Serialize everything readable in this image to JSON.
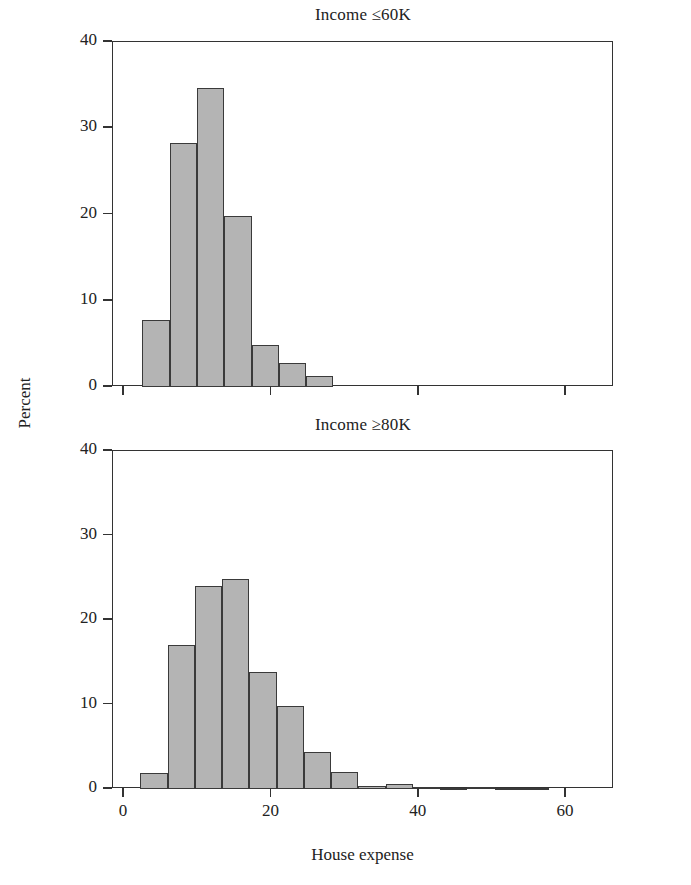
{
  "figure": {
    "ylabel": "Percent",
    "xlabel": "House expense"
  },
  "chart_data": [
    {
      "type": "bar",
      "title": "Income ≤60K",
      "panel": "top",
      "xlabel": "House expense",
      "ylabel": "Percent",
      "grid": false,
      "legend": "none",
      "xlim": [
        -1.5,
        66.5
      ],
      "ylim": [
        0,
        40
      ],
      "yticks": [
        0,
        10,
        20,
        30,
        40
      ],
      "ytick_labels": [
        "0",
        "10",
        "20",
        "30",
        "40"
      ],
      "xticks": [
        0,
        20,
        40,
        60
      ],
      "xtick_labels": [
        "0",
        "20",
        "40",
        "60"
      ],
      "bin_width": 3.7,
      "bin_starts": [
        2.5,
        6.2,
        9.9,
        13.6,
        17.3,
        21.0,
        24.7
      ],
      "bin_centers": [
        4.35,
        8.05,
        11.75,
        15.45,
        19.15,
        22.85,
        26.55
      ],
      "values": [
        7.8,
        28.3,
        34.7,
        19.8,
        4.9,
        2.8,
        1.3
      ]
    },
    {
      "type": "bar",
      "title": "Income ≥80K",
      "panel": "bottom",
      "xlabel": "House expense",
      "ylabel": "Percent",
      "grid": false,
      "legend": "none",
      "xlim": [
        -1.5,
        66.5
      ],
      "ylim": [
        0,
        40
      ],
      "yticks": [
        0,
        10,
        20,
        30,
        40
      ],
      "ytick_labels": [
        "0",
        "10",
        "20",
        "30",
        "40"
      ],
      "xticks": [
        0,
        20,
        40,
        60
      ],
      "xtick_labels": [
        "0",
        "20",
        "40",
        "60"
      ],
      "bin_width": 3.7,
      "bin_starts": [
        2.2,
        5.9,
        9.6,
        13.3,
        17.0,
        20.7,
        24.4,
        28.1,
        31.8,
        35.5,
        39.2,
        42.9,
        46.6,
        50.3,
        54.0
      ],
      "bin_centers": [
        4.05,
        7.75,
        11.45,
        15.15,
        18.85,
        22.55,
        26.25,
        29.95,
        33.65,
        37.35,
        41.05,
        44.75,
        48.45,
        52.15,
        55.85
      ],
      "values": [
        1.9,
        17.0,
        24.0,
        24.8,
        13.9,
        9.8,
        4.4,
        2.0,
        0.3,
        0.6,
        0.2,
        0.15,
        0.2,
        0.15,
        0.1
      ]
    }
  ],
  "style": {
    "bar_fill": "#b4b4b4",
    "bar_stroke": "#3a3a3a",
    "axis_color": "#333333",
    "text_color": "#222222",
    "background": "#ffffff"
  }
}
